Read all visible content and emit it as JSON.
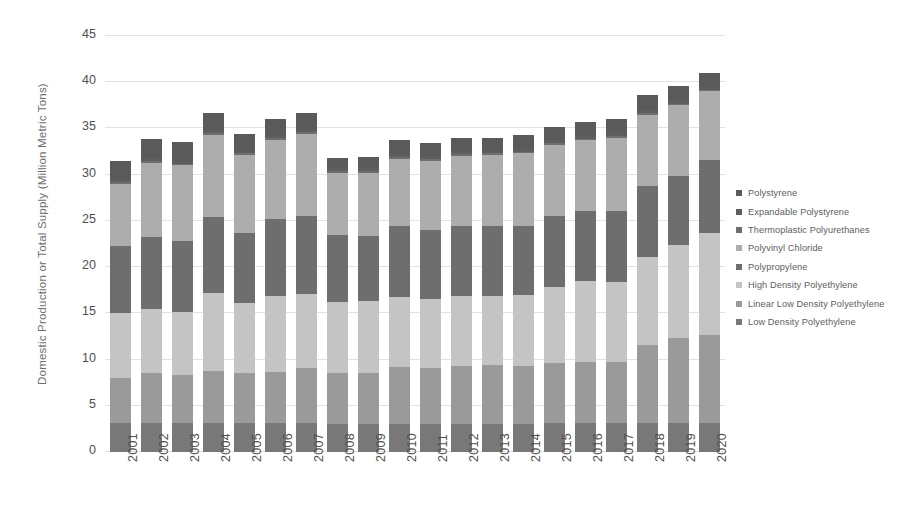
{
  "chart_data": {
    "type": "bar",
    "stacked": true,
    "title": "",
    "xlabel": "",
    "ylabel": "Domestic Production or Total Supply (Million Metric Tons)",
    "ylim": [
      0,
      45
    ],
    "ytick_step": 5,
    "yticks": [
      "45",
      "40",
      "35",
      "30",
      "25",
      "20",
      "15",
      "10",
      "5",
      "0"
    ],
    "grid": true,
    "legend_position": "right",
    "categories": [
      "2001",
      "2002",
      "2003",
      "2004",
      "2005",
      "2006",
      "2007",
      "2008",
      "2009",
      "2010",
      "2011",
      "2012",
      "2013",
      "2014",
      "2015",
      "2016",
      "2017",
      "2018",
      "2019",
      "2020"
    ],
    "series": [
      {
        "name": "Low Density Polyethylene",
        "color": "#787878",
        "values": [
          3.1,
          3.1,
          3.1,
          3.1,
          3.1,
          3.1,
          3.1,
          3.0,
          3.0,
          3.0,
          3.0,
          3.0,
          3.0,
          3.0,
          3.1,
          3.1,
          3.1,
          3.1,
          3.1,
          3.1
        ]
      },
      {
        "name": "Linear Low Density Polyethylene",
        "color": "#9a9a9a",
        "values": [
          4.9,
          5.5,
          5.2,
          5.7,
          5.5,
          5.6,
          6.0,
          5.5,
          5.6,
          6.2,
          6.1,
          6.3,
          6.4,
          6.3,
          6.5,
          6.6,
          6.6,
          8.5,
          9.2,
          9.6
        ]
      },
      {
        "name": "High Density Polyethylene",
        "color": "#c4c4c4",
        "values": [
          7.0,
          6.9,
          6.8,
          8.4,
          7.5,
          8.2,
          8.0,
          7.7,
          7.7,
          7.6,
          7.5,
          7.6,
          7.5,
          7.7,
          8.2,
          8.8,
          8.7,
          9.5,
          10.1,
          11.0
        ]
      },
      {
        "name": "Polypropylene",
        "color": "#6e6e6e",
        "values": [
          7.3,
          7.8,
          7.7,
          8.2,
          7.6,
          8.3,
          8.4,
          7.3,
          7.1,
          7.6,
          7.4,
          7.5,
          7.6,
          7.5,
          7.7,
          7.6,
          7.7,
          7.7,
          7.5,
          7.9
        ]
      },
      {
        "name": "Polyvinyl Chloride",
        "color": "#adadad",
        "values": [
          6.7,
          8.0,
          8.2,
          8.9,
          8.4,
          8.6,
          8.9,
          6.7,
          6.8,
          7.3,
          7.5,
          7.6,
          7.6,
          7.8,
          7.7,
          7.6,
          7.9,
          7.7,
          7.6,
          7.4
        ]
      },
      {
        "name": "Thermoplastic Polyurethanes",
        "color": "#6e6e6e",
        "values": [
          0.2,
          0.2,
          0.2,
          0.2,
          0.2,
          0.2,
          0.2,
          0.2,
          0.2,
          0.2,
          0.2,
          0.2,
          0.2,
          0.2,
          0.2,
          0.2,
          0.2,
          0.2,
          0.2,
          0.2
        ]
      },
      {
        "name": "Expandable Polystyrene",
        "color": "#5e5e5e",
        "values": [
          0.3,
          0.3,
          0.3,
          0.3,
          0.3,
          0.3,
          0.3,
          0.3,
          0.3,
          0.3,
          0.3,
          0.3,
          0.3,
          0.3,
          0.3,
          0.3,
          0.3,
          0.3,
          0.3,
          0.3
        ]
      },
      {
        "name": "Polystyrene",
        "color": "#5a5a5a",
        "values": [
          2.0,
          2.1,
          2.0,
          1.9,
          1.8,
          1.7,
          1.8,
          1.1,
          1.2,
          1.5,
          1.4,
          1.5,
          1.4,
          1.5,
          1.5,
          1.5,
          1.5,
          1.6,
          1.6,
          1.5
        ]
      }
    ]
  },
  "legend": {
    "items": [
      {
        "label": "Polystyrene",
        "color": "#5a5a5a"
      },
      {
        "label": "Expandable Polystyrene",
        "color": "#5e5e5e"
      },
      {
        "label": "Thermoplastic Polyurethanes",
        "color": "#6e6e6e"
      },
      {
        "label": "Polyvinyl Chloride",
        "color": "#adadad"
      },
      {
        "label": "Polypropylene",
        "color": "#6e6e6e"
      },
      {
        "label": "High Density Polyethylene",
        "color": "#c4c4c4"
      },
      {
        "label": "Linear Low Density Polyethylene",
        "color": "#9a9a9a"
      },
      {
        "label": "Low Density Polyethylene",
        "color": "#787878"
      }
    ]
  }
}
